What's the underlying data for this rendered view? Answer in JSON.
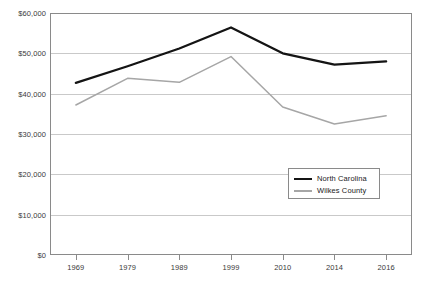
{
  "chart_data": {
    "type": "line",
    "title": "",
    "xlabel": "",
    "ylabel": "",
    "categories": [
      "1969",
      "1979",
      "1989",
      "1999",
      "2010",
      "2014",
      "2016"
    ],
    "ylim": [
      0,
      60000
    ],
    "ytick_values": [
      0,
      10000,
      20000,
      30000,
      40000,
      50000,
      60000
    ],
    "ytick_labels": [
      "$0",
      "$10,000",
      "$20,000",
      "$30,000",
      "$40,000",
      "$50,000",
      "$60,000"
    ],
    "grid": true,
    "legend_position": "inside-lower-right",
    "series": [
      {
        "name": "North Carolina",
        "color": "#141414",
        "width": 2.3,
        "values": [
          42700,
          46800,
          51200,
          56400,
          50000,
          47200,
          48000
        ]
      },
      {
        "name": "Wilkes County",
        "color": "#a6a6a6",
        "width": 1.5,
        "values": [
          37200,
          43800,
          42800,
          49200,
          36700,
          32500,
          34500
        ]
      }
    ]
  },
  "legend": {
    "items": [
      {
        "label": "North Carolina"
      },
      {
        "label": "Wilkes County"
      }
    ]
  },
  "colors": {
    "north_carolina": "#141414",
    "wilkes_county": "#a6a6a6",
    "gridline": "#c9c9c9",
    "axis": "#8a8a8a",
    "text": "#3a3a3a",
    "background": "#ffffff"
  }
}
